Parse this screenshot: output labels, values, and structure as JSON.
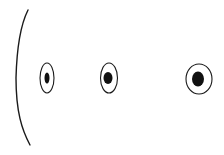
{
  "diagram": {
    "background": "#ffffff",
    "stroke_color": "#1a1a1a",
    "fill_color": "#111111",
    "arc": {
      "path": "M28,10 C22,22 17,40 16,78 C16,112 22,130 30,145",
      "stroke_width": 1.4
    },
    "ellipses": [
      {
        "name": "ellipse-small",
        "cx": 47,
        "cy": 78,
        "rx": 7,
        "ry": 15,
        "inner_rx": 2.5,
        "inner_ry": 5.5,
        "inner_dx": 0
      },
      {
        "name": "ellipse-medium",
        "cx": 109,
        "cy": 78,
        "rx": 8.5,
        "ry": 15,
        "inner_rx": 4.5,
        "inner_ry": 6,
        "inner_dx": -1
      },
      {
        "name": "ellipse-large",
        "cx": 199,
        "cy": 79,
        "rx": 13,
        "ry": 15,
        "inner_rx": 6,
        "inner_ry": 7.5,
        "inner_dx": -1
      }
    ]
  }
}
